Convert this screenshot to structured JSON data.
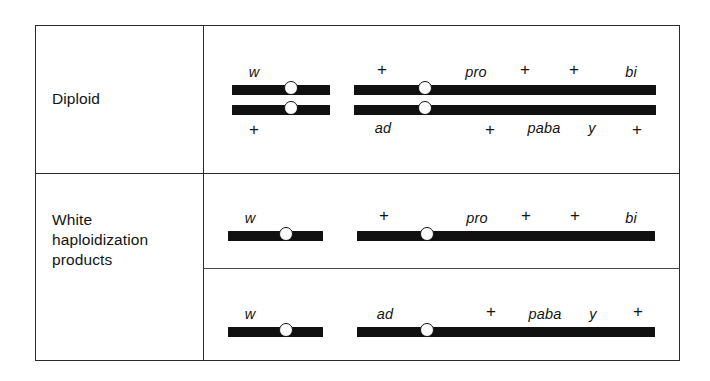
{
  "figure": {
    "type": "genetic-chromosome-map",
    "colors": {
      "bar": "#111111",
      "border": "#2b2b2b",
      "background": "#ffffff",
      "centromere_fill": "#ffffff"
    },
    "rows": [
      {
        "id": "diploid",
        "label": "Diploid",
        "chromosomes": [
          {
            "id": "diploid-homolog-a-short",
            "arm": "short",
            "markers_above": [
              "w"
            ],
            "markers_below": []
          },
          {
            "id": "diploid-homolog-a-long",
            "arm": "long",
            "markers_above": [
              "+",
              "pro",
              "+",
              "+",
              "bi"
            ],
            "markers_below": []
          },
          {
            "id": "diploid-homolog-b-short",
            "arm": "short",
            "markers_above": [],
            "markers_below": [
              "+"
            ]
          },
          {
            "id": "diploid-homolog-b-long",
            "arm": "long",
            "markers_above": [],
            "markers_below": [
              "ad",
              "+",
              "paba",
              "y",
              "+"
            ]
          }
        ]
      },
      {
        "id": "white-haploidization-products",
        "label": "White\nhaploidization\nproducts",
        "label_lines": [
          "White",
          "haploidization",
          "products"
        ],
        "chromosomes": [
          {
            "id": "product-1-short",
            "arm": "short",
            "markers_above": [
              "w"
            ],
            "markers_below": []
          },
          {
            "id": "product-1-long",
            "arm": "long",
            "markers_above": [
              "+",
              "pro",
              "+",
              "+",
              "bi"
            ],
            "markers_below": []
          },
          {
            "id": "product-2-short",
            "arm": "short",
            "markers_above": [
              "w"
            ],
            "markers_below": []
          },
          {
            "id": "product-2-long",
            "arm": "long",
            "markers_above": [
              "ad",
              "+",
              "paba",
              "y",
              "+"
            ],
            "markers_below": []
          }
        ]
      }
    ],
    "markers": {
      "r1_short_top": "w",
      "r1_short_bottom": "+",
      "r1_long_top_1": "+",
      "r1_long_top_2": "pro",
      "r1_long_top_3": "+",
      "r1_long_top_4": "+",
      "r1_long_top_5": "bi",
      "r1_long_bottom_1": "ad",
      "r1_long_bottom_2": "+",
      "r1_long_bottom_3": "paba",
      "r1_long_bottom_4": "y",
      "r1_long_bottom_5": "+",
      "r2_short_top": "w",
      "r2_long_top_1": "+",
      "r2_long_top_2": "pro",
      "r2_long_top_3": "+",
      "r2_long_top_4": "+",
      "r2_long_top_5": "bi",
      "r3_short_top": "w",
      "r3_long_top_1": "ad",
      "r3_long_top_2": "+",
      "r3_long_top_3": "paba",
      "r3_long_top_4": "y",
      "r3_long_top_5": "+"
    }
  }
}
